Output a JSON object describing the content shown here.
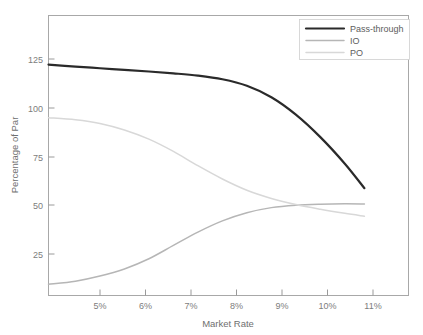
{
  "chart_data": {
    "type": "line",
    "title": "",
    "subtitle": "",
    "xlabel": "Market Rate",
    "ylabel": "Percentage of Par",
    "xlim": [
      4.45,
      11.8
    ],
    "ylim": [
      0,
      137
    ],
    "xticks": [
      5,
      6,
      7,
      8,
      9,
      10,
      11
    ],
    "xticklabels": [
      "5%",
      "6%",
      "7%",
      "8%",
      "9%",
      "10%",
      "11%"
    ],
    "yticks": [
      25,
      50,
      75,
      100,
      125
    ],
    "yticklabels": [
      "25",
      "50",
      "75",
      "100",
      "125"
    ],
    "grid": false,
    "legend_position": "top-right",
    "x": [
      4.45,
      5,
      5.5,
      6,
      6.5,
      7,
      7.5,
      8,
      8.5,
      9,
      9.5,
      10,
      10.5,
      10.9
    ],
    "series": [
      {
        "name": "Pass-through",
        "color": "#2a2a2a",
        "width": 2.2,
        "values": [
          113.0,
          112.0,
          111.2,
          110.4,
          109.6,
          108.7,
          107.6,
          105.8,
          102.6,
          97.0,
          88.5,
          77.5,
          64.5,
          52.5
        ]
      },
      {
        "name": "IO",
        "color": "#b6b6b6",
        "width": 1.5,
        "values": [
          5.5,
          7.0,
          9.5,
          13.0,
          18.0,
          24.5,
          31.0,
          36.5,
          40.5,
          43.0,
          44.2,
          44.7,
          44.9,
          44.8
        ]
      },
      {
        "name": "PO",
        "color": "#d8d8d8",
        "width": 1.5,
        "values": [
          87.0,
          86.0,
          84.2,
          81.0,
          76.5,
          70.5,
          63.5,
          57.0,
          51.5,
          47.5,
          44.5,
          42.2,
          40.2,
          38.8
        ]
      }
    ]
  },
  "legend": {
    "items": [
      {
        "label": "Pass-through"
      },
      {
        "label": "IO"
      },
      {
        "label": "PO"
      }
    ]
  },
  "axes": {
    "x_title": "Market Rate",
    "y_title": "Percentage of Par"
  },
  "colors": {
    "pass_through": "#2a2a2a",
    "io": "#b6b6b6",
    "po": "#d8d8d8",
    "frame": "#a8a8a8",
    "text": "#6f6f6f",
    "background": "#ffffff"
  }
}
